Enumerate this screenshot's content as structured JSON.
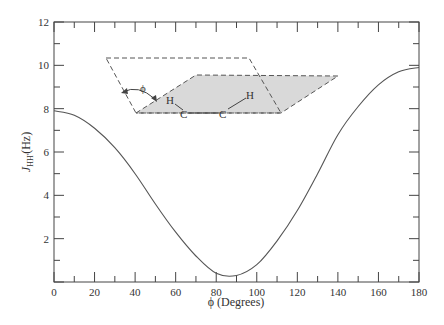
{
  "chart_data": {
    "type": "line",
    "title": "",
    "xlabel": "ϕ (Degrees)",
    "ylabel": "J_HH' (Hz)",
    "ylabel_main": "J",
    "ylabel_sub": "HH'",
    "ylabel_unit": "(Hz)",
    "xlim": [
      0,
      180
    ],
    "ylim": [
      0,
      12
    ],
    "xticks": [
      0,
      20,
      40,
      60,
      80,
      100,
      120,
      140,
      160,
      180
    ],
    "yticks": [
      2,
      4,
      6,
      8,
      10,
      12
    ],
    "grid": false,
    "legend": null,
    "series": [
      {
        "name": "Karplus curve",
        "x": [
          0,
          10,
          20,
          30,
          40,
          50,
          60,
          70,
          80,
          90,
          100,
          110,
          120,
          130,
          140,
          150,
          160,
          170,
          180
        ],
        "values": [
          7.9,
          7.7,
          7.1,
          6.2,
          5.0,
          3.6,
          2.3,
          1.2,
          0.4,
          0.3,
          0.8,
          1.9,
          3.3,
          5.0,
          6.8,
          8.1,
          9.1,
          9.7,
          9.9
        ]
      }
    ],
    "annotations": {
      "inset_diagram": "Dihedral angle diagram: two planes (H-C-C and C-C-H) with angle ϕ between them",
      "angle_label": "ϕ",
      "atoms": [
        "H",
        "C",
        "C",
        "H"
      ]
    }
  },
  "colors": {
    "axis": "#444444",
    "curve": "#555555",
    "plane_fill": "#d9d9d9",
    "dash": "#555555"
  }
}
